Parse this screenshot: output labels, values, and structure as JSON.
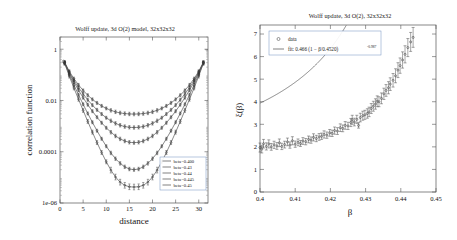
{
  "chart_data": [
    {
      "panel": "left",
      "type": "line",
      "title": "Wolff update, 3d O(2) model, 32x32x32",
      "xlabel": "distance",
      "ylabel": "correlation function",
      "xscale": "linear",
      "yscale": "log",
      "xlim": [
        0,
        32
      ],
      "ylim": [
        1e-06,
        3
      ],
      "grid": false,
      "legend_position": "bottom-right",
      "xticks": [
        0,
        5,
        10,
        15,
        20,
        25,
        30
      ],
      "xticklabels": [
        "0",
        "5",
        "10",
        "15",
        "20",
        "25",
        "30"
      ],
      "yticks": [
        1,
        0.01,
        0.0001,
        1e-06
      ],
      "yticklabels": [
        "1",
        "0.01",
        "0.0001",
        "1e-06"
      ],
      "x": [
        1,
        2,
        3,
        4,
        5,
        6,
        7,
        8,
        9,
        10,
        11,
        12,
        13,
        14,
        15,
        16,
        17,
        18,
        19,
        20,
        21,
        22,
        23,
        24,
        25,
        26,
        27,
        28,
        29,
        30,
        31
      ],
      "series": [
        {
          "name": "beta=0.400",
          "label": "beta=0.400",
          "values": [
            0.28,
            0.09,
            0.031,
            0.0112,
            0.0041,
            0.00152,
            0.00058,
            0.000228,
            9.35e-05,
            4.05e-05,
            1.92e-05,
            1.03e-05,
            6.5e-06,
            4.9e-06,
            4.3e-06,
            4.2e-06,
            4.3e-06,
            4.9e-06,
            6.5e-06,
            1.03e-05,
            1.92e-05,
            4.05e-05,
            9.35e-05,
            0.000228,
            0.00058,
            0.00152,
            0.0041,
            0.0112,
            0.031,
            0.09,
            0.28
          ]
        },
        {
          "name": "beta=0.43",
          "label": "beta=0.43",
          "values": [
            0.29,
            0.104,
            0.0405,
            0.0166,
            0.0071,
            0.00312,
            0.00141,
            0.00066,
            0.000321,
            0.000164,
            8.98e-05,
            5.35e-05,
            3.52e-05,
            2.58e-05,
            2.12e-05,
            2e-05,
            2.12e-05,
            2.58e-05,
            3.52e-05,
            5.35e-05,
            8.98e-05,
            0.000164,
            0.000321,
            0.00066,
            0.00141,
            0.00312,
            0.0071,
            0.0166,
            0.0405,
            0.104,
            0.29
          ]
        },
        {
          "name": "beta=0.44",
          "label": "beta=0.44",
          "values": [
            0.3,
            0.118,
            0.0525,
            0.0252,
            0.01285,
            0.00685,
            0.00382,
            0.00222,
            0.00135,
            0.00086,
            0.000577,
            0.000412,
            0.000317,
            0.000262,
            0.000234,
            0.000226,
            0.000234,
            0.000262,
            0.000317,
            0.000412,
            0.000577,
            0.00086,
            0.00135,
            0.00222,
            0.00382,
            0.00685,
            0.01285,
            0.0252,
            0.0525,
            0.118,
            0.3
          ]
        },
        {
          "name": "beta=0.445",
          "label": "beta=0.445",
          "values": [
            0.305,
            0.128,
            0.0615,
            0.0322,
            0.018,
            0.01062,
            0.0066,
            0.0043,
            0.00295,
            0.00212,
            0.00161,
            0.00128,
            0.00108,
            0.00096,
            0.0009,
            0.00088,
            0.0009,
            0.00096,
            0.00108,
            0.00128,
            0.00161,
            0.00212,
            0.00295,
            0.0043,
            0.0066,
            0.01062,
            0.018,
            0.0322,
            0.0615,
            0.128,
            0.305
          ]
        },
        {
          "name": "beta=0.45",
          "label": "beta=0.45",
          "values": [
            0.31,
            0.138,
            0.0715,
            0.0405,
            0.0247,
            0.01605,
            0.01105,
            0.00805,
            0.00615,
            0.00492,
            0.00412,
            0.0036,
            0.00327,
            0.00308,
            0.00298,
            0.00295,
            0.00298,
            0.00308,
            0.00327,
            0.0036,
            0.00412,
            0.00492,
            0.00615,
            0.00805,
            0.01105,
            0.01605,
            0.0247,
            0.0405,
            0.0715,
            0.138,
            0.31
          ]
        }
      ]
    },
    {
      "panel": "right",
      "type": "scatter",
      "title": "Wolff update, 3d O(2), 32x32x32",
      "xlabel": "β",
      "ylabel": "ξ(β)",
      "xscale": "linear",
      "yscale": "linear",
      "xlim": [
        0.4,
        0.45
      ],
      "ylim": [
        0,
        7.4
      ],
      "grid": false,
      "legend_position": "top-left",
      "xticks": [
        0.4,
        0.41,
        0.42,
        0.43,
        0.44,
        0.45
      ],
      "xticklabels": [
        "0.4",
        "0.41",
        "0.42",
        "0.43",
        "0.44",
        "0.45"
      ],
      "yticks": [
        0,
        1,
        2,
        3,
        4,
        5,
        6,
        7
      ],
      "yticklabels": [
        "0",
        "1",
        "2",
        "3",
        "4",
        "5",
        "6",
        "7"
      ],
      "legend_entries": [
        {
          "marker": "circle",
          "label": "data"
        },
        {
          "marker": "line",
          "label_prefix": "fit: 0.466 (1 − β/0.4520)",
          "label_exponent": "-0.987"
        }
      ],
      "fit": {
        "amplitude": 0.466,
        "beta_c": 0.452,
        "exponent": -0.987,
        "formula": "fit: 0.466 (1 − β/0.4520)^-0.987"
      },
      "data_points": [
        {
          "x": 0.4,
          "y": 1.97,
          "err": 0.2
        },
        {
          "x": 0.4005,
          "y": 1.9,
          "err": 0.17
        },
        {
          "x": 0.401,
          "y": 2.14,
          "err": 0.19
        },
        {
          "x": 0.4018,
          "y": 2.02,
          "err": 0.16
        },
        {
          "x": 0.4025,
          "y": 2.13,
          "err": 0.18
        },
        {
          "x": 0.4032,
          "y": 2.0,
          "err": 0.15
        },
        {
          "x": 0.404,
          "y": 2.09,
          "err": 0.16
        },
        {
          "x": 0.4048,
          "y": 2.04,
          "err": 0.15
        },
        {
          "x": 0.4055,
          "y": 2.18,
          "err": 0.17
        },
        {
          "x": 0.4062,
          "y": 2.02,
          "err": 0.14
        },
        {
          "x": 0.407,
          "y": 2.1,
          "err": 0.15
        },
        {
          "x": 0.4078,
          "y": 2.22,
          "err": 0.17
        },
        {
          "x": 0.4085,
          "y": 2.08,
          "err": 0.14
        },
        {
          "x": 0.4092,
          "y": 2.27,
          "err": 0.18
        },
        {
          "x": 0.41,
          "y": 2.12,
          "err": 0.14
        },
        {
          "x": 0.4108,
          "y": 2.2,
          "err": 0.15
        },
        {
          "x": 0.4115,
          "y": 2.15,
          "err": 0.13
        },
        {
          "x": 0.4122,
          "y": 2.26,
          "err": 0.15
        },
        {
          "x": 0.413,
          "y": 2.23,
          "err": 0.14
        },
        {
          "x": 0.4138,
          "y": 2.33,
          "err": 0.15
        },
        {
          "x": 0.4145,
          "y": 2.3,
          "err": 0.14
        },
        {
          "x": 0.4152,
          "y": 2.42,
          "err": 0.16
        },
        {
          "x": 0.416,
          "y": 2.37,
          "err": 0.14
        },
        {
          "x": 0.4168,
          "y": 2.44,
          "err": 0.15
        },
        {
          "x": 0.4175,
          "y": 2.47,
          "err": 0.14
        },
        {
          "x": 0.4182,
          "y": 2.55,
          "err": 0.16
        },
        {
          "x": 0.419,
          "y": 2.52,
          "err": 0.14
        },
        {
          "x": 0.4198,
          "y": 2.62,
          "err": 0.15
        },
        {
          "x": 0.4205,
          "y": 2.6,
          "err": 0.14
        },
        {
          "x": 0.4212,
          "y": 2.72,
          "err": 0.16
        },
        {
          "x": 0.422,
          "y": 2.7,
          "err": 0.15
        },
        {
          "x": 0.4228,
          "y": 2.85,
          "err": 0.17
        },
        {
          "x": 0.4235,
          "y": 2.82,
          "err": 0.15
        },
        {
          "x": 0.4242,
          "y": 2.95,
          "err": 0.17
        },
        {
          "x": 0.425,
          "y": 2.93,
          "err": 0.16
        },
        {
          "x": 0.4258,
          "y": 3.08,
          "err": 0.18
        },
        {
          "x": 0.4262,
          "y": 3.2,
          "err": 0.2
        },
        {
          "x": 0.4268,
          "y": 3.1,
          "err": 0.17
        },
        {
          "x": 0.4275,
          "y": 3.22,
          "err": 0.18
        },
        {
          "x": 0.428,
          "y": 2.95,
          "err": 0.12
        },
        {
          "x": 0.4285,
          "y": 3.3,
          "err": 0.19
        },
        {
          "x": 0.4292,
          "y": 3.38,
          "err": 0.2
        },
        {
          "x": 0.4298,
          "y": 3.42,
          "err": 0.2
        },
        {
          "x": 0.4305,
          "y": 3.48,
          "err": 0.21
        },
        {
          "x": 0.431,
          "y": 3.55,
          "err": 0.21
        },
        {
          "x": 0.4316,
          "y": 3.7,
          "err": 0.22
        },
        {
          "x": 0.4322,
          "y": 3.8,
          "err": 0.22
        },
        {
          "x": 0.4328,
          "y": 3.9,
          "err": 0.23
        },
        {
          "x": 0.4333,
          "y": 4.02,
          "err": 0.24
        },
        {
          "x": 0.4338,
          "y": 4.0,
          "err": 0.22
        },
        {
          "x": 0.4345,
          "y": 4.15,
          "err": 0.24
        },
        {
          "x": 0.4352,
          "y": 4.35,
          "err": 0.25
        },
        {
          "x": 0.4358,
          "y": 4.5,
          "err": 0.26
        },
        {
          "x": 0.4365,
          "y": 4.62,
          "err": 0.27
        },
        {
          "x": 0.437,
          "y": 4.78,
          "err": 0.28
        },
        {
          "x": 0.4378,
          "y": 4.95,
          "err": 0.3
        },
        {
          "x": 0.4385,
          "y": 5.15,
          "err": 0.31
        },
        {
          "x": 0.4392,
          "y": 5.4,
          "err": 0.33
        },
        {
          "x": 0.4398,
          "y": 5.6,
          "err": 0.34
        },
        {
          "x": 0.4405,
          "y": 5.85,
          "err": 0.36
        },
        {
          "x": 0.4412,
          "y": 6.1,
          "err": 0.38
        },
        {
          "x": 0.442,
          "y": 6.4,
          "err": 0.4
        },
        {
          "x": 0.4428,
          "y": 6.65,
          "err": 0.42
        },
        {
          "x": 0.4435,
          "y": 6.85,
          "err": 0.44
        }
      ]
    }
  ],
  "left_panel": {
    "title": "Wolff update, 3d O(2) model, 32x32x32",
    "xlabel": "distance",
    "ylabel": "correlation function",
    "xticklabels": [
      "0",
      "5",
      "10",
      "15",
      "20",
      "25",
      "30"
    ],
    "yticklabels": [
      "1",
      "0.01",
      "0.0001",
      "1e-06"
    ],
    "legend": [
      "beta=0.400",
      "beta=0.43",
      "beta=0.44",
      "beta=0.445",
      "beta=0.45"
    ]
  },
  "right_panel": {
    "title": "Wolff update, 3d O(2), 32x32x32",
    "xlabel": "β",
    "ylabel": "ξ(β)",
    "xticklabels": [
      "0.4",
      "0.41",
      "0.42",
      "0.43",
      "0.44",
      "0.45"
    ],
    "yticklabels": [
      "0",
      "1",
      "2",
      "3",
      "4",
      "5",
      "6",
      "7"
    ],
    "legend": {
      "data_label": "data",
      "fit_label_main": "fit: 0.466 (1 − β/0.4520)",
      "fit_label_exponent": "-0.987"
    }
  },
  "colors": {
    "curve": "#4a4a4a",
    "axis": "#555555",
    "text": "#1a1a1a",
    "legend_border": "#7090c0"
  }
}
